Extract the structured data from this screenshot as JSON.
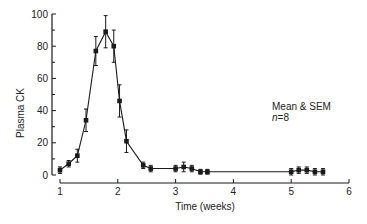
{
  "chart_data": {
    "type": "line",
    "title": "",
    "xlabel": "Time (weeks)",
    "ylabel": "Plasma CK",
    "xlim": [
      1,
      6
    ],
    "ylim": [
      0,
      100
    ],
    "x_ticks": [
      1,
      2,
      3,
      4,
      5,
      6
    ],
    "x_tick_labels": [
      "1",
      "2",
      "3",
      "4",
      "5",
      "6"
    ],
    "y_ticks": [
      0,
      20,
      40,
      60,
      80,
      100
    ],
    "y_tick_labels": [
      "0",
      "20",
      "40",
      "60",
      "80",
      "100"
    ],
    "y_minor_step": 10,
    "grid": false,
    "series": [
      {
        "name": "Mean & SEM",
        "marker": "square",
        "segments": [
          {
            "x": [
              1.0,
              1.15,
              1.3,
              1.45,
              1.62,
              1.79,
              1.93,
              2.03,
              2.15,
              2.44,
              2.57,
              3.0,
              3.14,
              3.28,
              3.43,
              3.55
            ],
            "y": [
              3,
              7,
              12,
              34,
              77,
              89,
              80,
              46,
              21,
              6,
              4,
              4,
              5,
              4,
              2,
              2
            ],
            "sem": [
              2,
              2,
              4,
              7,
              9,
              10,
              10,
              10,
              7,
              2,
              2,
              2,
              3,
              2,
              1.5,
              1.5
            ]
          },
          {
            "x": [
              5.0,
              5.13,
              5.27,
              5.41,
              5.55
            ],
            "y": [
              2,
              3,
              3,
              2,
              2
            ],
            "sem": [
              2,
              2,
              2,
              2,
              2
            ]
          }
        ],
        "bridge": {
          "from": [
            3.55,
            2
          ],
          "to": [
            5.0,
            2
          ]
        }
      }
    ],
    "annotations": [
      {
        "text": "Mean & SEM",
        "italic": false
      },
      {
        "text": "n=8",
        "italic_part": "n"
      }
    ]
  }
}
